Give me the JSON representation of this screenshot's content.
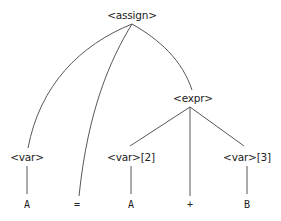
{
  "diagram": {
    "type": "parse-tree",
    "nodes": {
      "assign": {
        "label": "<assign>",
        "x": 132,
        "y": 15
      },
      "expr": {
        "label": "<expr>",
        "x": 193,
        "y": 98
      },
      "var1": {
        "label": "<var>",
        "x": 27,
        "y": 157
      },
      "var2": {
        "label": "<var>[2]",
        "x": 131,
        "y": 157
      },
      "var3": {
        "label": "<var>[3]",
        "x": 247,
        "y": 157
      },
      "leafA1": {
        "label": "A",
        "x": 27,
        "y": 204
      },
      "leafEq": {
        "label": "=",
        "x": 77,
        "y": 204
      },
      "leafA2": {
        "label": "A",
        "x": 131,
        "y": 204
      },
      "leafPlus": {
        "label": "+",
        "x": 190,
        "y": 204
      },
      "leafB": {
        "label": "B",
        "x": 247,
        "y": 204
      }
    },
    "edges": [
      [
        "assign",
        "var1"
      ],
      [
        "assign",
        "leafEq"
      ],
      [
        "assign",
        "expr"
      ],
      [
        "expr",
        "var2"
      ],
      [
        "expr",
        "leafPlus"
      ],
      [
        "expr",
        "var3"
      ],
      [
        "var1",
        "leafA1"
      ],
      [
        "var2",
        "leafA2"
      ],
      [
        "var3",
        "leafB"
      ]
    ]
  }
}
